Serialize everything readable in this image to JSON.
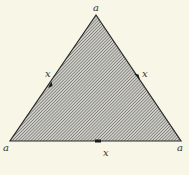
{
  "diagram": {
    "shape": "equilateral-triangle",
    "fill": "diagonal-hatching",
    "colors": {
      "background": "#f8f6e6",
      "stroke": "#2a2a2a",
      "hatch": "#555555",
      "hatch_bg": "#cfcfc8"
    },
    "vertices": [
      {
        "id": "top",
        "label": "a",
        "x": 96,
        "y": 15
      },
      {
        "id": "bottom-left",
        "label": "a",
        "x": 10,
        "y": 141
      },
      {
        "id": "bottom-right",
        "label": "a",
        "x": 181,
        "y": 141
      }
    ],
    "edges": [
      {
        "id": "left",
        "label": "x",
        "from": "bottom-left",
        "to": "top",
        "marker": "arrow"
      },
      {
        "id": "right",
        "label": "x",
        "from": "top",
        "to": "bottom-right",
        "marker": "arrow"
      },
      {
        "id": "bottom",
        "label": "x",
        "from": "bottom-right",
        "to": "bottom-left",
        "marker": "arrow"
      }
    ]
  }
}
